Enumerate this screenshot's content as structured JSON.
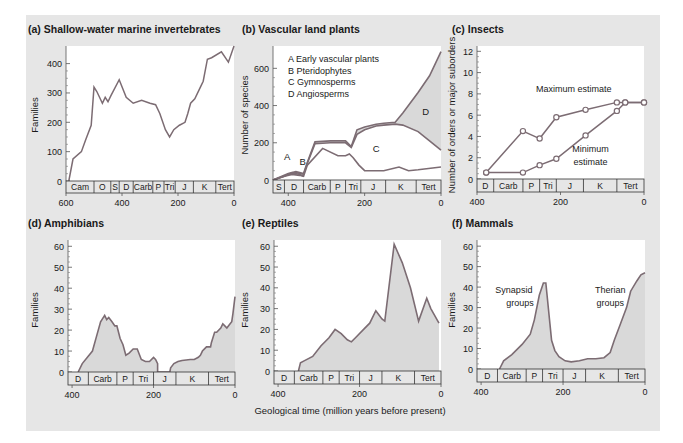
{
  "figure": {
    "x_caption": "Geological time (million years before present)",
    "colors": {
      "panel_bg": "#e6e6e6",
      "plot_bg": "#ffffff",
      "line": "#7c6c73",
      "fill": "#d9d9d9",
      "text": "#1a1a1a",
      "strip_border": "#333333"
    }
  },
  "chart_data": [
    {
      "id": "a",
      "title": "(a) Shallow-water marine invertebrates",
      "type": "line",
      "ylabel": "Families",
      "xlabel": "",
      "xlim": [
        600,
        0
      ],
      "ylim": [
        0,
        460
      ],
      "yticks": [
        0,
        100,
        200,
        300,
        400
      ],
      "xticks": [
        600,
        400,
        200,
        0
      ],
      "periods": [
        "Cam",
        "O",
        "S",
        "D",
        "Carb",
        "P",
        "Tri",
        "J",
        "K",
        "Tert"
      ],
      "period_bounds": [
        600,
        500,
        440,
        410,
        360,
        290,
        250,
        210,
        145,
        65,
        0
      ],
      "series": [
        {
          "name": "Families",
          "x": [
            590,
            575,
            545,
            530,
            510,
            500,
            490,
            470,
            460,
            450,
            440,
            410,
            385,
            360,
            330,
            300,
            280,
            265,
            245,
            230,
            215,
            195,
            175,
            165,
            155,
            140,
            120,
            110,
            95,
            80,
            45,
            20,
            0
          ],
          "y": [
            0,
            75,
            100,
            140,
            190,
            320,
            305,
            265,
            285,
            270,
            290,
            345,
            285,
            265,
            275,
            265,
            260,
            230,
            175,
            150,
            175,
            190,
            200,
            230,
            265,
            280,
            320,
            340,
            415,
            420,
            440,
            405,
            460
          ]
        }
      ]
    },
    {
      "id": "b",
      "title": "(b) Vascular land plants",
      "type": "area",
      "ylabel": "Number of species",
      "xlabel": "",
      "xlim": [
        440,
        0
      ],
      "ylim": [
        0,
        720
      ],
      "yticks": [
        0,
        200,
        400,
        600
      ],
      "xticks": [
        400,
        200,
        0
      ],
      "periods": [
        "S",
        "D",
        "Carb",
        "P",
        "Tri",
        "J",
        "K",
        "Tert"
      ],
      "period_bounds": [
        440,
        410,
        360,
        290,
        250,
        210,
        145,
        65,
        0
      ],
      "legend": [
        "A  Early vascular plants",
        "B  Pteridophytes",
        "C  Gymnosperms",
        "D  Angiosperms"
      ],
      "area_labels": [
        "A",
        "B",
        "C",
        "D"
      ],
      "series": [
        {
          "name": "A Early vascular plants (cumulative top)",
          "x": [
            440,
            410,
            390,
            370,
            360
          ],
          "y": [
            0,
            20,
            40,
            30,
            20
          ]
        },
        {
          "name": "B Pteridophytes (cumulative top)",
          "x": [
            440,
            410,
            390,
            370,
            360,
            350,
            310,
            270,
            250,
            240,
            230,
            215,
            200,
            150,
            110,
            85,
            60,
            0
          ],
          "y": [
            0,
            20,
            30,
            25,
            20,
            80,
            170,
            130,
            130,
            140,
            120,
            80,
            50,
            50,
            70,
            50,
            55,
            70
          ]
        },
        {
          "name": "C Gymnosperms (cumulative top)",
          "x": [
            440,
            400,
            380,
            360,
            350,
            330,
            290,
            270,
            250,
            235,
            220,
            200,
            170,
            150,
            120,
            100,
            60,
            30,
            0
          ],
          "y": [
            0,
            30,
            40,
            30,
            90,
            195,
            200,
            200,
            200,
            175,
            245,
            270,
            290,
            295,
            300,
            295,
            260,
            210,
            160
          ]
        },
        {
          "name": "D Angiosperms (cumulative top)",
          "x": [
            440,
            400,
            380,
            360,
            350,
            330,
            290,
            270,
            250,
            235,
            220,
            200,
            170,
            150,
            120,
            100,
            60,
            30,
            0
          ],
          "y": [
            0,
            35,
            45,
            35,
            95,
            205,
            210,
            210,
            210,
            180,
            270,
            285,
            300,
            305,
            310,
            360,
            470,
            560,
            690
          ]
        }
      ]
    },
    {
      "id": "c",
      "title": "(c) Insects",
      "type": "line",
      "ylabel": "Number of orders or major suborders",
      "xlabel": "",
      "xlim": [
        400,
        0
      ],
      "ylim": [
        0,
        12.5
      ],
      "yticks": [
        0,
        2,
        4,
        6,
        8,
        10,
        12
      ],
      "xticks": [
        400,
        200,
        0
      ],
      "periods": [
        "D",
        "Carb",
        "P",
        "Tri",
        "J",
        "K",
        "Tert"
      ],
      "period_bounds": [
        400,
        360,
        290,
        250,
        210,
        145,
        65,
        0
      ],
      "annotations": [
        "Maximum estimate",
        "Minimum estimate"
      ],
      "series": [
        {
          "name": "Maximum estimate",
          "x": [
            378,
            290,
            250,
            210,
            140,
            65,
            45,
            0
          ],
          "y": [
            0.6,
            4.5,
            3.8,
            5.8,
            6.5,
            7.2,
            7.2,
            7.2
          ]
        },
        {
          "name": "Minimum estimate",
          "x": [
            378,
            290,
            250,
            210,
            140,
            65,
            45,
            0
          ],
          "y": [
            0.6,
            0.6,
            1.3,
            1.9,
            4.1,
            6.4,
            7.2,
            7.2
          ]
        }
      ]
    },
    {
      "id": "d",
      "title": "(d) Amphibians",
      "type": "area",
      "ylabel": "Families",
      "xlabel": "",
      "xlim": [
        410,
        0
      ],
      "ylim": [
        0,
        63
      ],
      "yticks": [
        0,
        10,
        20,
        30,
        40,
        50,
        60
      ],
      "xticks": [
        400,
        200,
        0
      ],
      "periods": [
        "D",
        "Carb",
        "P",
        "Tri",
        "J",
        "K",
        "Tert"
      ],
      "period_bounds": [
        410,
        360,
        290,
        250,
        200,
        145,
        65,
        0
      ],
      "series": [
        {
          "name": "Families",
          "x": [
            385,
            375,
            350,
            340,
            330,
            320,
            315,
            310,
            302,
            295,
            290,
            282,
            275,
            268,
            260,
            250,
            240,
            230,
            220,
            210,
            200,
            195,
            190,
            190,
            160,
            158,
            150,
            140,
            130,
            110,
            100,
            90,
            85,
            80,
            70,
            60,
            58,
            50,
            45,
            35,
            30,
            25,
            20,
            12,
            8,
            5,
            0
          ],
          "y": [
            0,
            4,
            10,
            17,
            24,
            27,
            25,
            26,
            24,
            22,
            22,
            16,
            13,
            8,
            9,
            11,
            11,
            6,
            5,
            5,
            7,
            6,
            4,
            0,
            0,
            2,
            4,
            5,
            5.5,
            6,
            6,
            7,
            8,
            10,
            12,
            12,
            14,
            19,
            19,
            21,
            23,
            22,
            21,
            23,
            24,
            28,
            36
          ]
        }
      ]
    },
    {
      "id": "e",
      "title": "(e) Reptiles",
      "type": "area",
      "ylabel": "Families",
      "xlabel": "Geological time (million years before present)",
      "xlim": [
        410,
        0
      ],
      "ylim": [
        0,
        63
      ],
      "yticks": [
        0,
        10,
        20,
        30,
        40,
        50,
        60
      ],
      "xticks": [
        400,
        200,
        0
      ],
      "periods": [
        "D",
        "Carb",
        "P",
        "Tri",
        "J",
        "K",
        "Tert"
      ],
      "period_bounds": [
        410,
        360,
        290,
        250,
        200,
        145,
        65,
        0
      ],
      "series": [
        {
          "name": "Families",
          "x": [
            350,
            345,
            335,
            315,
            295,
            275,
            260,
            245,
            230,
            220,
            210,
            190,
            175,
            160,
            145,
            138,
            115,
            95,
            75,
            55,
            35,
            25,
            5
          ],
          "y": [
            0,
            4,
            5,
            7,
            12,
            16,
            20,
            18,
            15,
            14,
            16,
            20,
            23,
            29,
            25,
            24,
            61,
            52,
            40,
            24,
            35,
            30,
            23
          ]
        }
      ]
    },
    {
      "id": "f",
      "title": "(f) Mammals",
      "type": "area",
      "ylabel": "Families",
      "xlabel": "",
      "xlim": [
        410,
        0
      ],
      "ylim": [
        0,
        63
      ],
      "yticks": [
        0,
        10,
        20,
        30,
        40,
        50,
        60
      ],
      "xticks": [
        400,
        200,
        0
      ],
      "periods": [
        "D",
        "Carb",
        "P",
        "Tri",
        "J",
        "K",
        "Tert"
      ],
      "period_bounds": [
        410,
        360,
        290,
        250,
        200,
        145,
        65,
        0
      ],
      "annotations": [
        "Synapsid groups",
        "Therian groups"
      ],
      "series": [
        {
          "name": "Families",
          "x": [
            355,
            345,
            325,
            300,
            280,
            270,
            258,
            248,
            242,
            232,
            228,
            220,
            210,
            195,
            180,
            160,
            140,
            120,
            100,
            85,
            75,
            60,
            45,
            35,
            20,
            10,
            0
          ],
          "y": [
            0,
            4,
            7,
            12,
            17,
            24,
            36,
            42,
            42,
            22,
            14,
            9,
            6,
            4,
            3.5,
            4,
            5,
            5,
            5.5,
            8,
            14,
            22,
            30,
            38,
            43,
            46,
            47
          ]
        }
      ]
    }
  ]
}
